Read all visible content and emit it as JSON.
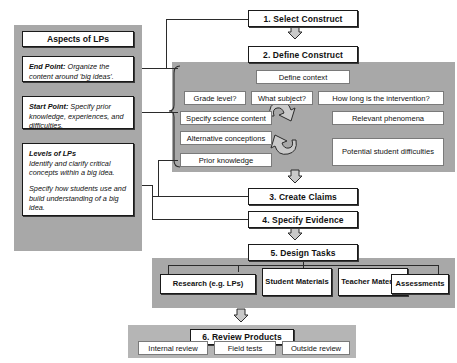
{
  "left_panel": {
    "title": "Aspects of LPs",
    "items": [
      {
        "name": "end-point",
        "label": "End Point:",
        "text": " Organize the content around 'big ideas'."
      },
      {
        "name": "start-point",
        "label": "Start Point:",
        "text": " Specify prior knowledge, experiences, and difficulties."
      },
      {
        "name": "levels-of-lps",
        "label": "Levels of LPs",
        "text": "Identify and clarify critical concepts within a big idea.",
        "text2": "Specify how students use and build understanding of a big idea."
      }
    ]
  },
  "steps": {
    "step1": "1. Select Construct",
    "step2": "2. Define Construct",
    "step3": "3. Create Claims",
    "step4": "4. Specify Evidence",
    "step5": "5. Design Tasks",
    "step6": "6. Review Products"
  },
  "define_construct_panel": {
    "define_context": "Define context",
    "context_items": [
      "Grade level?",
      "What subject?",
      "How long is the intervention?"
    ],
    "left_items": [
      "Specify science content",
      "Alternative conceptions",
      "Prior knowledge"
    ],
    "right_items": [
      "Relevant phenomena",
      "Potential student difficulties"
    ],
    "cycle_icon": "circular-arrows-icon"
  },
  "design_tasks_panel": {
    "items": [
      "Research (e.g. LPs)",
      "Student Materials",
      "Teacher Materials",
      "Assessments"
    ]
  },
  "review_panel": {
    "items": [
      "Internal review",
      "Field tests",
      "Outside review"
    ]
  },
  "colors": {
    "panel_gray": "#a8a8a8",
    "panel_gray_light": "#b5b5b5",
    "box_white": "#ffffff",
    "line": "#2b2b2b"
  }
}
